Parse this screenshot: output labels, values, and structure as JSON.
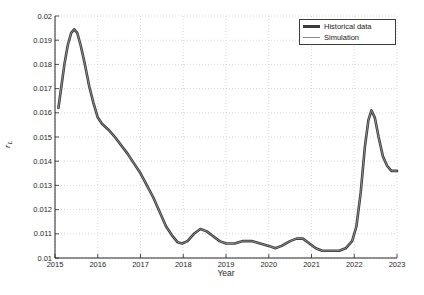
{
  "figure": {
    "background": "#ffffff",
    "xlabel": "Year",
    "ylabel_main": "r",
    "ylabel_sub": "L"
  },
  "legend": {
    "position": "top-right",
    "items": [
      {
        "label": "Historical data",
        "line_color": "#3a3a3a",
        "line_width": 2.6
      },
      {
        "label": "Simulation",
        "line_color": "#8c8c8c",
        "line_width": 1.0
      }
    ]
  },
  "colors": {
    "axis": "#262626",
    "tick_text": "#262626",
    "grid": "#cccccc",
    "plot_background": "#ffffff"
  },
  "chart_data": {
    "type": "line",
    "title": "",
    "xlabel": "Year",
    "ylabel": "r_L",
    "xlim": [
      2015,
      2023
    ],
    "ylim": [
      0.01,
      0.02
    ],
    "grid": true,
    "grid_style": "dotted",
    "legend_position": "top-right",
    "x_ticks": [
      2015,
      2016,
      2017,
      2018,
      2019,
      2020,
      2021,
      2022,
      2023
    ],
    "x_tick_labels": [
      "2015",
      "2016",
      "2017",
      "2018",
      "2019",
      "2020",
      "2021",
      "2022",
      "2023"
    ],
    "y_ticks": [
      0.01,
      0.011,
      0.012,
      0.013,
      0.014,
      0.015,
      0.016,
      0.017,
      0.018,
      0.019,
      0.02
    ],
    "y_tick_labels": [
      "0.01",
      "0.011",
      "0.012",
      "0.013",
      "0.014",
      "0.015",
      "0.016",
      "0.017",
      "0.018",
      "0.019",
      "0.02"
    ],
    "series": [
      {
        "name": "Historical data",
        "color": "#3a3a3a",
        "width": 2.6,
        "points": [
          [
            2015.08,
            0.0162
          ],
          [
            2015.15,
            0.0171
          ],
          [
            2015.22,
            0.018
          ],
          [
            2015.3,
            0.0188
          ],
          [
            2015.38,
            0.0193
          ],
          [
            2015.45,
            0.01945
          ],
          [
            2015.52,
            0.0193
          ],
          [
            2015.6,
            0.0188
          ],
          [
            2015.7,
            0.018
          ],
          [
            2015.8,
            0.0171
          ],
          [
            2015.9,
            0.0164
          ],
          [
            2016.0,
            0.0158
          ],
          [
            2016.1,
            0.01555
          ],
          [
            2016.25,
            0.0153
          ],
          [
            2016.4,
            0.015
          ],
          [
            2016.55,
            0.01465
          ],
          [
            2016.7,
            0.0143
          ],
          [
            2016.85,
            0.0139
          ],
          [
            2017.0,
            0.0135
          ],
          [
            2017.15,
            0.013
          ],
          [
            2017.3,
            0.0125
          ],
          [
            2017.45,
            0.0119
          ],
          [
            2017.6,
            0.0113
          ],
          [
            2017.75,
            0.0109
          ],
          [
            2017.87,
            0.01065
          ],
          [
            2017.97,
            0.0106
          ],
          [
            2018.1,
            0.0107
          ],
          [
            2018.25,
            0.011
          ],
          [
            2018.4,
            0.0112
          ],
          [
            2018.55,
            0.0111
          ],
          [
            2018.7,
            0.0109
          ],
          [
            2018.85,
            0.0107
          ],
          [
            2019.0,
            0.0106
          ],
          [
            2019.2,
            0.0106
          ],
          [
            2019.4,
            0.0107
          ],
          [
            2019.6,
            0.0107
          ],
          [
            2019.8,
            0.0106
          ],
          [
            2020.0,
            0.0105
          ],
          [
            2020.15,
            0.0104
          ],
          [
            2020.3,
            0.0105
          ],
          [
            2020.5,
            0.0107
          ],
          [
            2020.65,
            0.0108
          ],
          [
            2020.8,
            0.0108
          ],
          [
            2020.95,
            0.0106
          ],
          [
            2021.1,
            0.0104
          ],
          [
            2021.25,
            0.0103
          ],
          [
            2021.45,
            0.0103
          ],
          [
            2021.65,
            0.0103
          ],
          [
            2021.8,
            0.0104
          ],
          [
            2021.95,
            0.0107
          ],
          [
            2022.05,
            0.0113
          ],
          [
            2022.15,
            0.0127
          ],
          [
            2022.25,
            0.0146
          ],
          [
            2022.33,
            0.0157
          ],
          [
            2022.4,
            0.0161
          ],
          [
            2022.48,
            0.0158
          ],
          [
            2022.57,
            0.015
          ],
          [
            2022.67,
            0.0142
          ],
          [
            2022.77,
            0.0138
          ],
          [
            2022.87,
            0.0136
          ],
          [
            2023.0,
            0.0136
          ]
        ]
      },
      {
        "name": "Simulation",
        "color": "#8c8c8c",
        "width": 1.0,
        "points": [
          [
            2015.08,
            0.0162
          ],
          [
            2015.15,
            0.0171
          ],
          [
            2015.22,
            0.018
          ],
          [
            2015.3,
            0.0188
          ],
          [
            2015.38,
            0.0193
          ],
          [
            2015.45,
            0.01945
          ],
          [
            2015.52,
            0.0193
          ],
          [
            2015.6,
            0.0188
          ],
          [
            2015.7,
            0.018
          ],
          [
            2015.8,
            0.0171
          ],
          [
            2015.9,
            0.0164
          ],
          [
            2016.0,
            0.0158
          ],
          [
            2016.1,
            0.01555
          ],
          [
            2016.25,
            0.0153
          ],
          [
            2016.4,
            0.015
          ],
          [
            2016.55,
            0.01465
          ],
          [
            2016.7,
            0.0143
          ],
          [
            2016.85,
            0.0139
          ],
          [
            2017.0,
            0.0135
          ],
          [
            2017.15,
            0.013
          ],
          [
            2017.3,
            0.0125
          ],
          [
            2017.45,
            0.0119
          ],
          [
            2017.6,
            0.0113
          ],
          [
            2017.75,
            0.0109
          ],
          [
            2017.87,
            0.01065
          ],
          [
            2017.97,
            0.0106
          ],
          [
            2018.1,
            0.0107
          ],
          [
            2018.25,
            0.011
          ],
          [
            2018.4,
            0.0112
          ],
          [
            2018.55,
            0.0111
          ],
          [
            2018.7,
            0.0109
          ],
          [
            2018.85,
            0.0107
          ],
          [
            2019.0,
            0.0106
          ],
          [
            2019.2,
            0.0106
          ],
          [
            2019.4,
            0.0107
          ],
          [
            2019.6,
            0.0107
          ],
          [
            2019.8,
            0.0106
          ],
          [
            2020.0,
            0.0105
          ],
          [
            2020.15,
            0.0104
          ],
          [
            2020.3,
            0.0105
          ],
          [
            2020.5,
            0.0107
          ],
          [
            2020.65,
            0.0108
          ],
          [
            2020.8,
            0.0108
          ],
          [
            2020.95,
            0.0106
          ],
          [
            2021.1,
            0.0104
          ],
          [
            2021.25,
            0.0103
          ],
          [
            2021.45,
            0.0103
          ],
          [
            2021.65,
            0.0103
          ],
          [
            2021.8,
            0.0104
          ],
          [
            2021.95,
            0.0107
          ],
          [
            2022.05,
            0.0113
          ],
          [
            2022.15,
            0.0127
          ],
          [
            2022.25,
            0.0146
          ],
          [
            2022.33,
            0.0157
          ],
          [
            2022.4,
            0.0161
          ],
          [
            2022.48,
            0.0158
          ],
          [
            2022.57,
            0.015
          ],
          [
            2022.67,
            0.0142
          ],
          [
            2022.77,
            0.0138
          ],
          [
            2022.87,
            0.0136
          ],
          [
            2023.0,
            0.0136
          ]
        ]
      }
    ]
  }
}
